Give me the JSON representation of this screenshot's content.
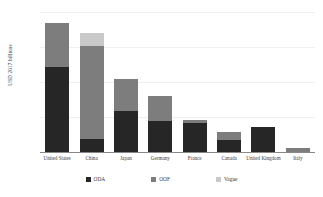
{
  "chart_data": {
    "type": "bar",
    "title": "",
    "subtitle": "",
    "xlabel": "",
    "ylabel": "USD 2017 billions",
    "ylim": [
      0,
      500
    ],
    "yticks": [
      "$0",
      "$125",
      "$250",
      "$375",
      "$500"
    ],
    "ytick_values": [
      0,
      125,
      250,
      375,
      500
    ],
    "grid": true,
    "stacked": true,
    "legend_position": "bottom",
    "categories": [
      "United States",
      "China",
      "Japan",
      "Germany",
      "France",
      "Canada",
      "United Kingdom",
      "Italy"
    ],
    "series": [
      {
        "name": "ODA",
        "color": "#262626",
        "values": [
          305,
          45,
          145,
          110,
          105,
          42,
          90,
          0
        ]
      },
      {
        "name": "OOF",
        "color": "#7d7d7d",
        "values": [
          155,
          335,
          115,
          90,
          10,
          28,
          0,
          15
        ]
      },
      {
        "name": "Vague",
        "color": "#c9c9c9",
        "values": [
          0,
          45,
          0,
          0,
          0,
          0,
          0,
          0
        ]
      }
    ],
    "totals": [
      460,
      425,
      260,
      200,
      115,
      70,
      90,
      15
    ]
  },
  "legend": {
    "items": [
      {
        "label": "ODA",
        "color": "#262626",
        "swatch": "square-swatch"
      },
      {
        "label": "OOF",
        "color": "#7d7d7d",
        "swatch": "square-swatch"
      },
      {
        "label": "Vague",
        "color": "#c9c9c9",
        "swatch": "square-swatch"
      }
    ]
  }
}
